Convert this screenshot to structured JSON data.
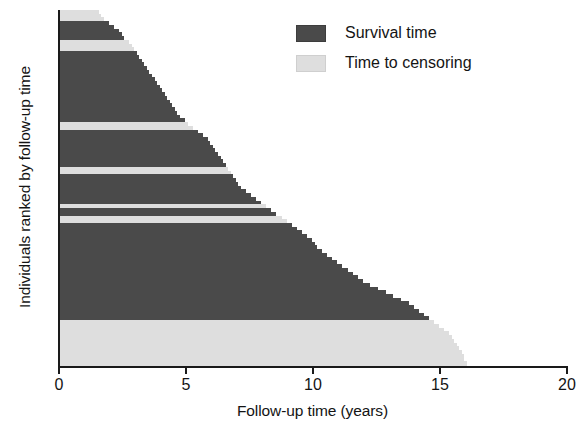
{
  "chart_data": {
    "type": "bar",
    "orientation": "horizontal",
    "title": "",
    "xlabel": "Follow-up time (years)",
    "ylabel": "Individuals ranked by follow-up time",
    "xlim": [
      0,
      20
    ],
    "xticks": [
      0,
      5,
      10,
      15,
      20
    ],
    "xticklabels": [
      "0",
      "5",
      "10",
      "15",
      "20"
    ],
    "grid": false,
    "legend_position": "top-right",
    "legend": [
      {
        "label": "Survival time",
        "color": "#4a4a4a",
        "key": "death"
      },
      {
        "label": "Time to censoring",
        "color": "#dedede",
        "key": "censor"
      }
    ],
    "series_names": [
      "Survival time",
      "Time to censoring"
    ],
    "y_description": "One horizontal bar per individual, sorted by increasing follow-up time from top to bottom",
    "n_individuals": 95,
    "values": [
      1.6,
      1.7,
      1.8,
      2.0,
      2.2,
      2.4,
      2.5,
      2.6,
      2.8,
      2.9,
      3.0,
      3.1,
      3.2,
      3.3,
      3.4,
      3.5,
      3.6,
      3.7,
      3.8,
      3.9,
      4.0,
      4.1,
      4.2,
      4.3,
      4.4,
      4.5,
      4.6,
      4.7,
      4.8,
      5.0,
      5.1,
      5.3,
      5.5,
      5.7,
      5.9,
      6.0,
      6.1,
      6.2,
      6.3,
      6.4,
      6.5,
      6.6,
      6.7,
      6.8,
      6.9,
      7.0,
      7.1,
      7.2,
      7.4,
      7.6,
      7.8,
      8.0,
      8.2,
      8.4,
      8.6,
      8.8,
      9.0,
      9.2,
      9.4,
      9.6,
      9.8,
      10.0,
      10.1,
      10.2,
      10.4,
      10.6,
      10.8,
      11.0,
      11.2,
      11.4,
      11.6,
      11.8,
      12.0,
      12.3,
      12.6,
      12.9,
      13.2,
      13.5,
      13.8,
      14.0,
      14.2,
      14.4,
      14.6,
      14.8,
      15.0,
      15.2,
      15.4,
      15.5,
      15.6,
      15.7,
      15.8,
      15.9,
      16.0,
      16.0,
      16.1
    ],
    "statuses": [
      "censor",
      "censor",
      "censor",
      "death",
      "death",
      "death",
      "death",
      "death",
      "censor",
      "censor",
      "censor",
      "death",
      "death",
      "death",
      "death",
      "death",
      "death",
      "death",
      "death",
      "death",
      "death",
      "death",
      "death",
      "death",
      "death",
      "death",
      "death",
      "death",
      "death",
      "death",
      "censor",
      "censor",
      "death",
      "death",
      "death",
      "death",
      "death",
      "death",
      "death",
      "death",
      "death",
      "death",
      "censor",
      "censor",
      "death",
      "death",
      "death",
      "death",
      "death",
      "death",
      "death",
      "death",
      "censor",
      "death",
      "death",
      "censor",
      "censor",
      "death",
      "death",
      "death",
      "death",
      "death",
      "death",
      "death",
      "death",
      "death",
      "death",
      "death",
      "death",
      "death",
      "death",
      "death",
      "death",
      "death",
      "death",
      "death",
      "death",
      "death",
      "death",
      "death",
      "death",
      "death",
      "death",
      "censor",
      "censor",
      "censor",
      "censor",
      "censor",
      "censor",
      "censor",
      "censor",
      "censor",
      "censor",
      "censor",
      "censor"
    ]
  }
}
